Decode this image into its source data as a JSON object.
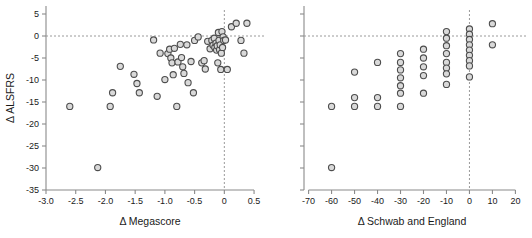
{
  "figure": {
    "background": "#ffffff",
    "marker_fill": "#d9d9d9",
    "marker_stroke": "#4d4d4d",
    "axis_color": "#8a8a8a",
    "refline_color": "#9a9a9a"
  },
  "chart_data": [
    {
      "type": "scatter",
      "panel": "left",
      "title": "",
      "xlabel": "Δ Megascore",
      "ylabel": "Δ ALSFRS",
      "xlim": [
        -3.0,
        0.6
      ],
      "ylim": [
        -35,
        5
      ],
      "xticks": [
        -3.0,
        -2.5,
        -2.0,
        -1.5,
        -1.0,
        -0.5,
        0,
        0.5
      ],
      "xticklabels": [
        "-3.0",
        "-2.5",
        "-2.0",
        "-1.5",
        "-1.0",
        "-0.5",
        "0",
        "0.5"
      ],
      "yticks": [
        5,
        0,
        -5,
        -10,
        -15,
        -20,
        -25,
        -30,
        -35
      ],
      "yticklabels": [
        "5",
        "0",
        "-5",
        "-10",
        "-15",
        "-20",
        "-25",
        "-30",
        "-35"
      ],
      "grid": false,
      "legend": null,
      "reference_lines": [
        {
          "axis": "y",
          "value": 0,
          "style": "dotted"
        },
        {
          "axis": "x",
          "value": 0,
          "style": "dotted"
        }
      ],
      "points": [
        [
          -2.6,
          -16.0
        ],
        [
          -2.13,
          -29.9
        ],
        [
          -1.92,
          -16.0
        ],
        [
          -1.88,
          -12.9
        ],
        [
          -1.75,
          -6.9
        ],
        [
          -1.52,
          -8.7
        ],
        [
          -1.47,
          -10.8
        ],
        [
          -1.43,
          -12.9
        ],
        [
          -1.19,
          -0.9
        ],
        [
          -1.13,
          -13.7
        ],
        [
          -1.08,
          -3.9
        ],
        [
          -1.0,
          -9.9
        ],
        [
          -0.95,
          -4.0
        ],
        [
          -0.92,
          -3.0
        ],
        [
          -0.9,
          -5.0
        ],
        [
          -0.88,
          -6.1
        ],
        [
          -0.86,
          -8.8
        ],
        [
          -0.84,
          -2.8
        ],
        [
          -0.8,
          -16.0
        ],
        [
          -0.78,
          -5.9
        ],
        [
          -0.74,
          -1.9
        ],
        [
          -0.72,
          -4.9
        ],
        [
          -0.7,
          -7.0
        ],
        [
          -0.68,
          -8.5
        ],
        [
          -0.63,
          -2.0
        ],
        [
          -0.61,
          -10.6
        ],
        [
          -0.56,
          -5.8
        ],
        [
          -0.52,
          -12.9
        ],
        [
          -0.5,
          -1.0
        ],
        [
          -0.44,
          -0.2
        ],
        [
          -0.38,
          -6.1
        ],
        [
          -0.34,
          -5.6
        ],
        [
          -0.32,
          -7.5
        ],
        [
          -0.28,
          -1.2
        ],
        [
          -0.24,
          -2.9
        ],
        [
          -0.21,
          -1.0
        ],
        [
          -0.19,
          -2.1
        ],
        [
          -0.17,
          -0.5
        ],
        [
          -0.16,
          -2.6
        ],
        [
          -0.14,
          -1.6
        ],
        [
          -0.13,
          -3.2
        ],
        [
          -0.12,
          -2.2
        ],
        [
          -0.11,
          -6.1
        ],
        [
          -0.1,
          0.8
        ],
        [
          -0.09,
          -1.0
        ],
        [
          -0.08,
          -3.1
        ],
        [
          -0.07,
          -2.0
        ],
        [
          -0.06,
          -7.6
        ],
        [
          -0.05,
          -3.9
        ],
        [
          -0.04,
          1.0
        ],
        [
          -0.03,
          -2.6
        ],
        [
          -0.02,
          -0.2
        ],
        [
          -0.01,
          -1.0
        ],
        [
          0.02,
          -0.9
        ],
        [
          0.05,
          -7.6
        ],
        [
          0.12,
          2.1
        ],
        [
          0.2,
          2.9
        ],
        [
          0.28,
          -1.0
        ],
        [
          0.33,
          -3.9
        ],
        [
          0.38,
          2.9
        ]
      ]
    },
    {
      "type": "scatter",
      "panel": "right",
      "title": "",
      "xlabel": "Δ Schwab and England",
      "ylabel": "",
      "xlim": [
        -72,
        22
      ],
      "ylim": [
        -35,
        5
      ],
      "xticks": [
        -70,
        -60,
        -50,
        -40,
        -30,
        -20,
        -10,
        0,
        10,
        20
      ],
      "xticklabels": [
        "-70",
        "-60",
        "-50",
        "-40",
        "-30",
        "-20",
        "-10",
        "0",
        "10",
        "20"
      ],
      "yticks": [
        5,
        0,
        -5,
        -10,
        -15,
        -20,
        -25,
        -30,
        -35
      ],
      "yticklabels": [],
      "grid": false,
      "legend": null,
      "reference_lines": [
        {
          "axis": "y",
          "value": 0,
          "style": "dotted"
        },
        {
          "axis": "x",
          "value": 0,
          "style": "dotted"
        }
      ],
      "points": [
        [
          -60,
          -29.9
        ],
        [
          -60,
          -16.0
        ],
        [
          -50,
          -8.2
        ],
        [
          -50,
          -14.0
        ],
        [
          -50,
          -16.0
        ],
        [
          -40,
          -6.0
        ],
        [
          -40,
          -14.0
        ],
        [
          -40,
          -16.0
        ],
        [
          -30,
          -4.0
        ],
        [
          -30,
          -6.0
        ],
        [
          -30,
          -7.7
        ],
        [
          -30,
          -9.5
        ],
        [
          -30,
          -11.3
        ],
        [
          -30,
          -13.0
        ],
        [
          -30,
          -16.0
        ],
        [
          -20,
          -3.0
        ],
        [
          -20,
          -5.0
        ],
        [
          -20,
          -7.0
        ],
        [
          -20,
          -9.0
        ],
        [
          -20,
          -13.0
        ],
        [
          -10,
          1.0
        ],
        [
          -10,
          -0.5
        ],
        [
          -10,
          -2.2
        ],
        [
          -10,
          -4.0
        ],
        [
          -10,
          -6.0
        ],
        [
          -10,
          -7.3
        ],
        [
          -10,
          -8.6
        ],
        [
          -10,
          -11.0
        ],
        [
          0,
          1.6
        ],
        [
          0,
          0.4
        ],
        [
          0,
          -0.8
        ],
        [
          0,
          -2.0
        ],
        [
          0,
          -3.2
        ],
        [
          0,
          -4.4
        ],
        [
          0,
          -5.6
        ],
        [
          0,
          -6.8
        ],
        [
          0,
          -9.3
        ],
        [
          10,
          2.8
        ],
        [
          10,
          -2.0
        ]
      ]
    }
  ]
}
